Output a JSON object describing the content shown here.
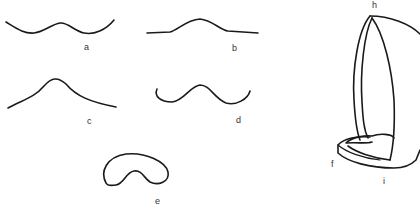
{
  "figure": {
    "panels": [
      {
        "id": "a",
        "label": "a",
        "shape": "symmetric double-trough curve with central hump"
      },
      {
        "id": "b",
        "label": "b",
        "shape": "flat line with central bell-shaped rise"
      },
      {
        "id": "c",
        "label": "c",
        "shape": "single peaked arch"
      },
      {
        "id": "d",
        "label": "d",
        "shape": "wave curve with upturned ends"
      },
      {
        "id": "e",
        "label": "e",
        "shape": "closed kidney/bean shaped outline"
      },
      {
        "id": "3d",
        "labels": [
          "h",
          "f",
          "i"
        ],
        "shape": "three-dimensional tilted shell form"
      }
    ],
    "labels": {
      "a": "a",
      "b": "b",
      "c": "c",
      "d": "d",
      "e": "e",
      "f": "f",
      "h": "h",
      "i": "i"
    },
    "colors": {
      "line": "#1a1a1a",
      "background": "#ffffff",
      "label": "#333333"
    }
  }
}
